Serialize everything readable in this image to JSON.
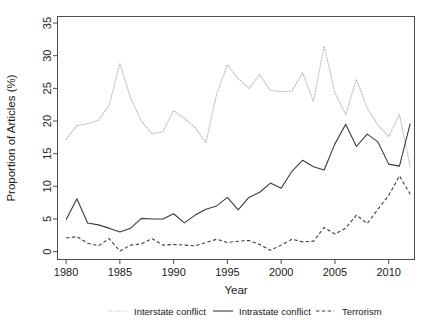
{
  "chart_data": {
    "type": "line",
    "title": "",
    "xlabel": "Year",
    "ylabel": "Proportion of Articles (%)",
    "xlim": [
      1979.2,
      2012.4
    ],
    "ylim": [
      -1.2,
      36.0
    ],
    "grid": false,
    "legend_position": "bottom",
    "xticks": [
      1980,
      1985,
      1990,
      1995,
      2000,
      2005,
      2010
    ],
    "xtick_labels": [
      "1980",
      "1985",
      "1990",
      "1995",
      "2000",
      "2005",
      "2010"
    ],
    "yticks": [
      0,
      5,
      10,
      15,
      20,
      25,
      30,
      35
    ],
    "ytick_labels": [
      "0",
      "5",
      "10",
      "15",
      "20",
      "25",
      "30",
      "35"
    ],
    "x": [
      1980,
      1981,
      1982,
      1983,
      1984,
      1985,
      1986,
      1987,
      1988,
      1989,
      1990,
      1991,
      1992,
      1993,
      1994,
      1995,
      1996,
      1997,
      1998,
      1999,
      2000,
      2001,
      2002,
      2003,
      2004,
      2005,
      2006,
      2007,
      2008,
      2009,
      2010,
      2011,
      2012
    ],
    "series": [
      {
        "name": "Interstate conflict",
        "style": "dotted",
        "color": "#b9b9b9",
        "values": [
          17.2,
          19.3,
          19.6,
          20.1,
          22.4,
          28.8,
          23.5,
          20.0,
          18.0,
          18.4,
          21.6,
          20.4,
          19.0,
          16.7,
          24.1,
          28.6,
          26.5,
          25.0,
          27.1,
          24.7,
          24.5,
          24.6,
          27.4,
          23.0,
          31.5,
          24.3,
          21.0,
          26.4,
          22.0,
          19.4,
          17.6,
          21.0,
          13.0
        ]
      },
      {
        "name": "Intrastate conflict",
        "style": "solid",
        "color": "#3b3b3b",
        "values": [
          4.9,
          8.1,
          4.4,
          4.1,
          3.6,
          3.0,
          3.6,
          5.1,
          5.0,
          5.0,
          5.8,
          4.4,
          5.6,
          6.5,
          7.0,
          8.3,
          6.4,
          8.3,
          9.1,
          10.5,
          9.7,
          12.3,
          14.0,
          13.0,
          12.5,
          16.5,
          19.5,
          16.1,
          18.0,
          16.8,
          13.4,
          13.1,
          19.6
        ]
      },
      {
        "name": "Terrorism",
        "style": "dashed",
        "color": "#3b3b3b",
        "values": [
          2.1,
          2.3,
          1.3,
          0.9,
          2.0,
          0.1,
          1.0,
          1.2,
          2.0,
          1.0,
          1.1,
          1.0,
          0.9,
          1.4,
          1.9,
          1.4,
          1.6,
          1.7,
          1.1,
          0.2,
          1.0,
          1.9,
          1.5,
          1.6,
          3.7,
          2.7,
          3.6,
          5.6,
          4.3,
          6.5,
          8.6,
          11.6,
          8.8
        ]
      }
    ]
  },
  "legend": {
    "items": [
      {
        "label": "Interstate conflict",
        "key": "dotted-line-key"
      },
      {
        "label": "Intrastate conflict",
        "key": "solid-line-key"
      },
      {
        "label": "Terrorism",
        "key": "dashed-line-key"
      }
    ]
  }
}
